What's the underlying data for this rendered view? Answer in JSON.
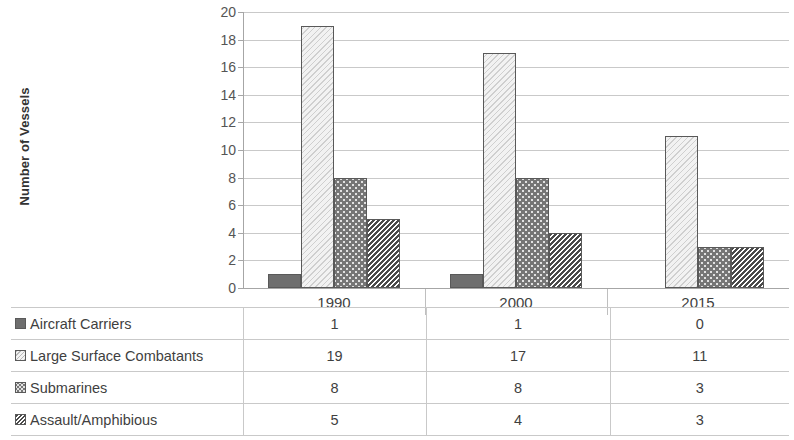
{
  "chart_data": {
    "type": "bar",
    "title": "",
    "xlabel": "",
    "ylabel": "Number of Vessels",
    "categories": [
      "1990",
      "2000",
      "2015"
    ],
    "ylim": [
      0,
      20
    ],
    "ytick_step": 2,
    "yticks": [
      "20",
      "18",
      "16",
      "14",
      "12",
      "10",
      "8",
      "6",
      "4",
      "2",
      "0"
    ],
    "grid": true,
    "legend_position": "data-table",
    "series": [
      {
        "name": "Aircraft Carriers",
        "values": [
          1,
          1,
          0
        ],
        "pattern": "solid",
        "color": "#6e6e6e"
      },
      {
        "name": "Large Surface Combatants",
        "values": [
          19,
          17,
          11
        ],
        "pattern": "diagonal-hatch",
        "color": "#f2f2f2"
      },
      {
        "name": "Submarines",
        "values": [
          8,
          8,
          3
        ],
        "pattern": "dotted",
        "color": "#767676"
      },
      {
        "name": "Assault/Amphibious",
        "values": [
          5,
          4,
          3
        ],
        "pattern": "zigzag",
        "color": "#ffffff"
      }
    ]
  },
  "table": {
    "header": [
      "",
      "1990",
      "2000",
      "2015"
    ],
    "rows": [
      {
        "label": "Aircraft Carriers",
        "values": [
          "1",
          "1",
          "0"
        ]
      },
      {
        "label": "Large Surface Combatants",
        "values": [
          "19",
          "17",
          "11"
        ]
      },
      {
        "label": "Submarines",
        "values": [
          "8",
          "8",
          "3"
        ]
      },
      {
        "label": "Assault/Amphibious",
        "values": [
          "5",
          "4",
          "3"
        ]
      }
    ]
  }
}
